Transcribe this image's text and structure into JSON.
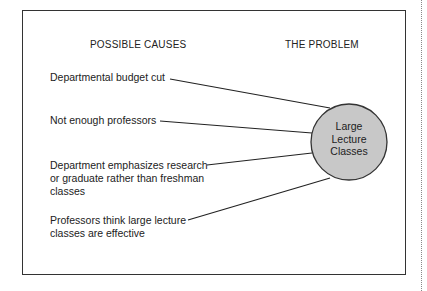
{
  "headers": {
    "causes": "POSSIBLE CAUSES",
    "problem": "THE PROBLEM"
  },
  "causes": [
    {
      "label": "Departmental budget cut"
    },
    {
      "label": "Not enough professors"
    },
    {
      "label": "Department emphasizes research or graduate rather than freshman classes"
    },
    {
      "label": "Professors think large lecture classes are effective"
    }
  ],
  "problem": {
    "line1": "Large",
    "line2": "Lecture",
    "line3": "Classes",
    "fill": "#c8c8c8"
  }
}
